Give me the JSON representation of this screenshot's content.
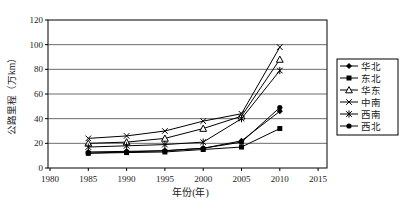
{
  "chart_data": {
    "type": "line",
    "title": "",
    "xlabel": "年份(年)",
    "ylabel": "公路里程（万km）",
    "xlim": [
      1980,
      2015
    ],
    "ylim": [
      0,
      120
    ],
    "x": [
      1985,
      1990,
      1995,
      2000,
      2005,
      2010
    ],
    "x_ticks": [
      "1980",
      "1985",
      "1990",
      "1995",
      "2000",
      "2005",
      "2010",
      "2015"
    ],
    "y_ticks": [
      "0",
      "20",
      "40",
      "60",
      "80",
      "100",
      "120"
    ],
    "grid": true,
    "legend_position": "right",
    "line_color": "#000000",
    "grid_color": "#3a3a3a",
    "background": "#ffffff",
    "series": [
      {
        "name": "华北",
        "marker": "diamond",
        "values": [
          13,
          13.5,
          14,
          16,
          22,
          46
        ]
      },
      {
        "name": "东北",
        "marker": "square",
        "values": [
          12,
          12.5,
          13,
          15,
          17,
          32
        ]
      },
      {
        "name": "华东",
        "marker": "triangle-open",
        "values": [
          20,
          21,
          24,
          32,
          42,
          88
        ]
      },
      {
        "name": "中南",
        "marker": "x",
        "values": [
          24,
          26,
          30,
          38,
          44,
          98
        ]
      },
      {
        "name": "西南",
        "marker": "star",
        "values": [
          17,
          18,
          19,
          21,
          40,
          79
        ]
      },
      {
        "name": "西北",
        "marker": "circle",
        "values": [
          12,
          13,
          14,
          16,
          21,
          49
        ]
      }
    ]
  }
}
